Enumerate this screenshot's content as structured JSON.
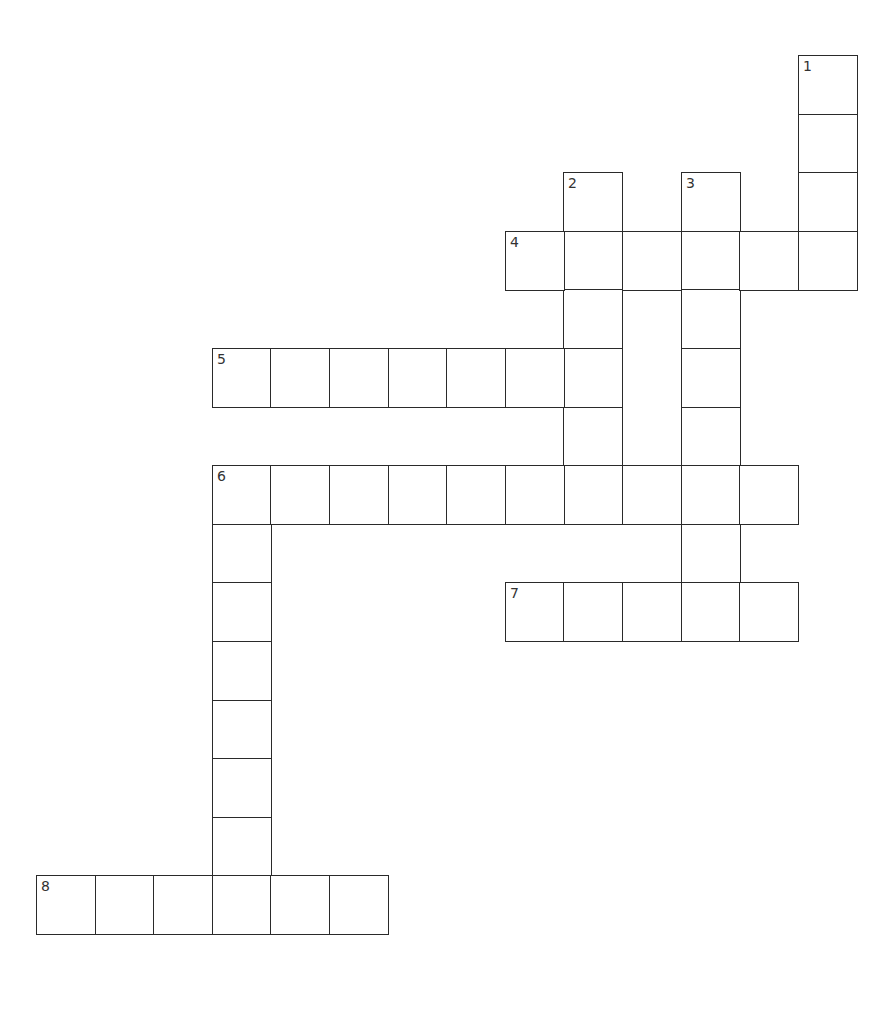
{
  "puzzle": {
    "type": "crossword",
    "cell_size_px": 58.6,
    "origin_px": [
      36,
      55
    ],
    "line_color": "#2a2a2a",
    "background": "#ffffff",
    "entries": [
      {
        "number": "1",
        "direction": "down",
        "row": 0,
        "col": 13,
        "length": 4
      },
      {
        "number": "2",
        "direction": "down",
        "row": 2,
        "col": 9,
        "length": 6
      },
      {
        "number": "3",
        "direction": "down",
        "row": 2,
        "col": 11,
        "length": 8
      },
      {
        "number": "4",
        "direction": "across",
        "row": 3,
        "col": 8,
        "length": 6
      },
      {
        "number": "5",
        "direction": "across",
        "row": 5,
        "col": 3,
        "length": 7
      },
      {
        "number": "6",
        "direction": "across",
        "row": 7,
        "col": 3,
        "length": 10
      },
      {
        "number": "6",
        "direction": "down",
        "row": 7,
        "col": 3,
        "length": 8
      },
      {
        "number": "7",
        "direction": "across",
        "row": 9,
        "col": 8,
        "length": 5
      },
      {
        "number": "8",
        "direction": "across",
        "row": 14,
        "col": 0,
        "length": 6
      }
    ]
  }
}
